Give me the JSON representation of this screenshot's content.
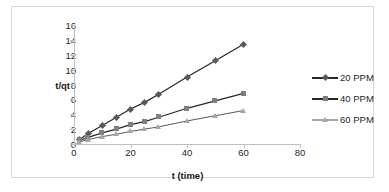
{
  "chart_data": {
    "type": "line",
    "title": "",
    "xlabel": "t (time)",
    "ylabel": "t/qt",
    "xlim": [
      0,
      80
    ],
    "ylim": [
      0,
      16
    ],
    "xticks": [
      0,
      20,
      40,
      60,
      80
    ],
    "yticks": [
      0,
      2,
      4,
      6,
      8,
      10,
      12,
      14,
      16
    ],
    "grid": false,
    "legend_position": "right",
    "x": [
      2,
      5,
      10,
      15,
      20,
      25,
      30,
      40,
      50,
      60
    ],
    "series": [
      {
        "name": "20 PPM",
        "marker": "diamond",
        "color": "#595959",
        "line_color": "#262626",
        "values": [
          0.6,
          1.4,
          2.5,
          3.6,
          4.7,
          5.6,
          6.7,
          9.0,
          11.2,
          13.4
        ]
      },
      {
        "name": "40 PPM",
        "marker": "square",
        "color": "#7f7f7f",
        "line_color": "#262626",
        "values": [
          0.5,
          0.9,
          1.5,
          2.0,
          2.6,
          3.0,
          3.6,
          4.8,
          5.8,
          6.8
        ]
      },
      {
        "name": "60 PPM",
        "marker": "triangle",
        "color": "#a6a6a6",
        "line_color": "#595959",
        "values": [
          0.3,
          0.6,
          1.0,
          1.3,
          1.7,
          2.0,
          2.3,
          3.1,
          3.8,
          4.5
        ]
      }
    ]
  },
  "axes": {
    "y_tick_labels": [
      "16",
      "14",
      "12",
      "10",
      "8",
      "6",
      "4",
      "2",
      "0"
    ],
    "x_tick_labels": [
      "0",
      "20",
      "40",
      "60",
      "80"
    ],
    "y_axis_title": "t/qt",
    "x_axis_title": "t (time)"
  },
  "legend": {
    "items": [
      {
        "label": "20 PPM"
      },
      {
        "label": "40 PPM"
      },
      {
        "label": "60 PPM"
      }
    ]
  },
  "colors": {
    "axis": "#bfbfbf",
    "border": "#d9d9d9",
    "text": "#262626",
    "series_20ppm": "#595959",
    "series_40ppm": "#7f7f7f",
    "series_60ppm": "#a6a6a6"
  }
}
